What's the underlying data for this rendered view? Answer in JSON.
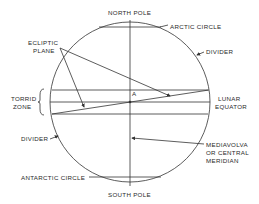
{
  "diagram": {
    "labels": {
      "north_pole": "NORTH POLE",
      "south_pole": "SOUTH POLE",
      "arctic_circle": "ARCTIC CIRCLE",
      "antarctic_circle": "ANTARCTIC CIRCLE",
      "divider_top": "DIVIDER",
      "divider_bottom": "DIVIDER",
      "ecliptic_line1": "ECLIPTIC",
      "ecliptic_line2": "PLANE",
      "torrid_line1": "TORRID",
      "torrid_line2": "ZONE",
      "lunar_line1": "LUNAR",
      "lunar_line2": "EQUATOR",
      "point_a": "A",
      "meridian_line1": "MEDIAVOLVA",
      "meridian_line2": "OR CENTRAL",
      "meridian_line3": "MERIDIAN"
    },
    "colors": {
      "line": "#333333",
      "text": "#2a2a2a",
      "background": "#ffffff"
    }
  }
}
